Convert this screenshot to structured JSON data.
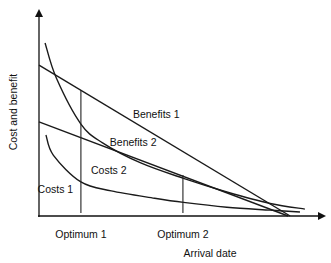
{
  "chart_data": {
    "type": "line",
    "title": "",
    "xlabel": "Arrival date",
    "ylabel": "Cost and benefit",
    "xlim": [
      0,
      10
    ],
    "ylim": [
      0,
      10
    ],
    "grid": false,
    "series": [
      {
        "name": "Benefits 1",
        "label": "Benefits 1",
        "kind": "straight",
        "points": [
          [
            0,
            7.22
          ],
          [
            8.69,
            0
          ]
        ]
      },
      {
        "name": "Benefits 2",
        "label": "Benefits 2",
        "kind": "straight",
        "points": [
          [
            0,
            4.5
          ],
          [
            8.62,
            0
          ]
        ]
      },
      {
        "name": "Costs 2",
        "label": "Costs 2",
        "kind": "curve",
        "points": [
          [
            0.21,
            8.28
          ],
          [
            0.6,
            6.6
          ],
          [
            1.45,
            4.4
          ],
          [
            2.2,
            3.5
          ],
          [
            3.5,
            2.55
          ],
          [
            5.0,
            1.8
          ],
          [
            6.5,
            1.15
          ],
          [
            8.0,
            0.6
          ],
          [
            9.2,
            0.33
          ]
        ]
      },
      {
        "name": "Costs 1",
        "label": "Costs 1",
        "kind": "curve",
        "points": [
          [
            0.24,
            3.88
          ],
          [
            0.5,
            2.9
          ],
          [
            1.45,
            1.63
          ],
          [
            2.5,
            1.2
          ],
          [
            4.0,
            0.85
          ],
          [
            5.0,
            0.65
          ],
          [
            6.5,
            0.42
          ],
          [
            8.0,
            0.28
          ],
          [
            9.03,
            0.19
          ]
        ]
      }
    ],
    "annotations": [
      {
        "text": "Optimum 1",
        "x": 1.45,
        "y_top": 6.03
      },
      {
        "text": "Optimum 2",
        "x": 4.98,
        "y_top": 1.96
      }
    ],
    "label_positions": {
      "Benefits 1": [
        3.25,
        4.7
      ],
      "Benefits 2": [
        2.45,
        3.35
      ],
      "Costs 2": [
        1.8,
        2.0
      ],
      "Costs 1": [
        -0.05,
        1.1
      ]
    }
  }
}
